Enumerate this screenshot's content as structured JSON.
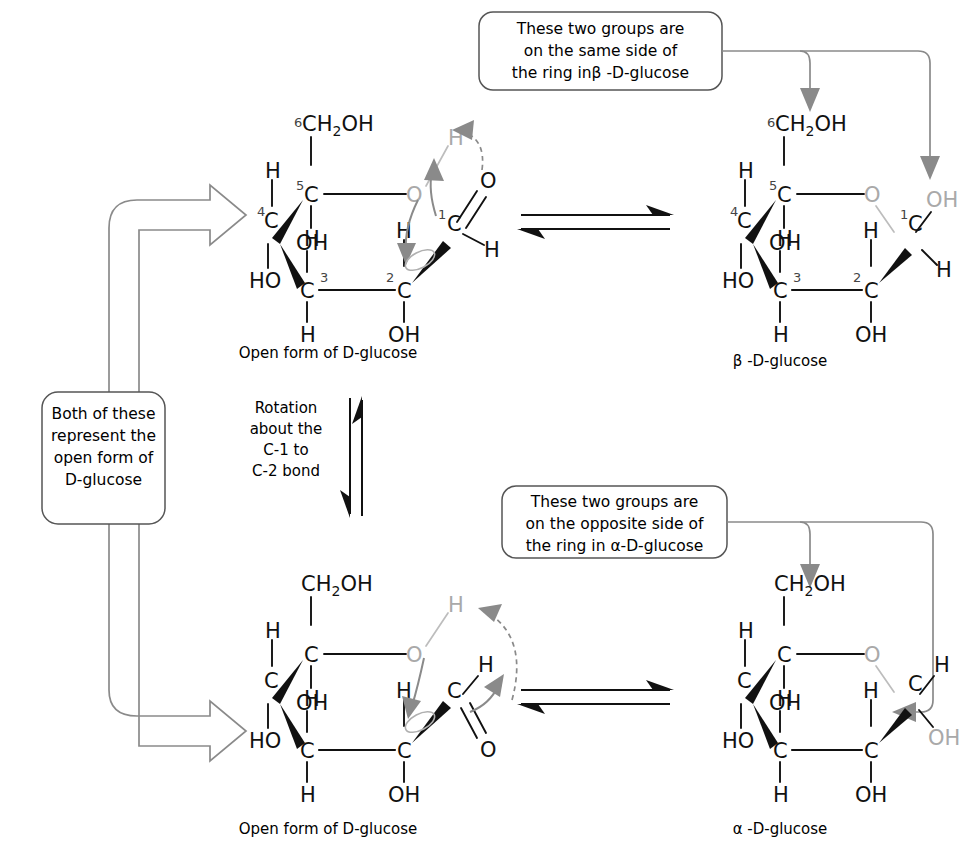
{
  "figure": {
    "accent_gray": "#8a8a8a",
    "ink": "#111111",
    "pale_gray": "#bdbdbd"
  },
  "callouts": {
    "beta": {
      "name": "beta-callout",
      "lines": [
        "These two groups are",
        "on the same side of",
        "the ring inβ -D-glucose"
      ]
    },
    "alpha": {
      "name": "alpha-callout",
      "lines": [
        "These two groups are",
        "on the opposite side of",
        "the ring in α-D-glucose"
      ]
    },
    "open_form": {
      "name": "open-form-callout",
      "lines": [
        "Both of these",
        "represent the",
        "open form of",
        "D-glucose"
      ]
    }
  },
  "rotation_note": {
    "lines": [
      "Rotation",
      "about the",
      "C-1 to",
      "C-2 bond"
    ]
  },
  "captions": {
    "top_left": "Open form of D-glucose",
    "bottom_left": "Open form of D-glucose",
    "top_right": "β -D-glucose",
    "bottom_right": "α -D-glucose"
  },
  "structures": {
    "top_left": {
      "name": "open-form-d-glucose-top",
      "locants": [
        "6",
        "5",
        "4",
        "3",
        "2",
        "1"
      ],
      "labels": {
        "c6": "CH",
        "c6_sub": "2",
        "c6_oh": "OH",
        "c5": "C",
        "c5_h": "H",
        "c4": "C",
        "c4_h": "H",
        "c4_ho": "HO",
        "c3": "C",
        "c3_oh": "OH",
        "c3_h": "H",
        "c2": "C",
        "c2_h": "H",
        "c2_oh": "OH",
        "c1": "C",
        "c1_h": "H",
        "ring_o": "O",
        "hydroxyl_h": "H",
        "carbonyl_o": "O"
      }
    },
    "top_right": {
      "name": "beta-d-glucose",
      "locants": [
        "6",
        "5",
        "4",
        "3",
        "2",
        "1"
      ],
      "labels": {
        "c6": "CH",
        "c6_sub": "2",
        "c6_oh": "OH",
        "c5": "C",
        "c5_h": "H",
        "c4": "C",
        "c4_h": "H",
        "c4_ho": "HO",
        "c3": "C",
        "c3_oh": "OH",
        "c3_h": "H",
        "c2": "C",
        "c2_h": "H",
        "c2_oh": "OH",
        "c1": "C",
        "c1_h": "H",
        "c1_oh": "OH",
        "ring_o": "O"
      }
    },
    "bottom_left": {
      "name": "open-form-d-glucose-bottom",
      "labels": {
        "c6": "CH",
        "c6_sub": "2",
        "c6_oh": "OH",
        "c5": "C",
        "c5_h": "H",
        "c4": "C",
        "c4_h": "H",
        "c4_ho": "HO",
        "c3": "C",
        "c3_oh": "OH",
        "c3_h": "H",
        "c2": "C",
        "c2_h": "H",
        "c2_oh": "OH",
        "c1": "C",
        "c1_h": "H",
        "ring_o": "O",
        "hydroxyl_h": "H",
        "carbonyl_o": "O"
      }
    },
    "bottom_right": {
      "name": "alpha-d-glucose",
      "labels": {
        "c6": "CH",
        "c6_sub": "2",
        "c6_oh": "OH",
        "c5": "C",
        "c5_h": "H",
        "c4": "C",
        "c4_h": "H",
        "c4_ho": "HO",
        "c3": "C",
        "c3_oh": "OH",
        "c3_h": "H",
        "c2": "C",
        "c2_h": "H",
        "c2_oh": "OH",
        "c1": "C",
        "c1_h": "H",
        "c1_oh": "OH",
        "ring_o": "O"
      }
    }
  }
}
